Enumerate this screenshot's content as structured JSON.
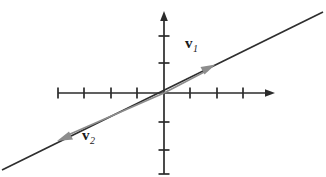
{
  "figure": {
    "background_color": "#ffffff",
    "width": 326,
    "height": 177
  },
  "axes": {
    "origin": {
      "x": 164,
      "y": 93
    },
    "color": "#2b2b2b",
    "tick_color": "#2b2b2b",
    "tick_spacing_px": 26.5,
    "tick_length_px": 11,
    "x_axis": {
      "name": "x-axis",
      "start_x": 58,
      "end_x": 275,
      "y": 93,
      "arrow_end": "right",
      "tick_positions_x": [
        58,
        84,
        111,
        137,
        190,
        217,
        243
      ],
      "label": ""
    },
    "y_axis": {
      "name": "y-axis",
      "x": 164,
      "start_y": 174,
      "end_y": 12,
      "arrow_end": "top",
      "tick_positions_y": [
        36,
        63,
        122,
        150,
        174
      ],
      "label": ""
    }
  },
  "line": {
    "name": "collinear-support-line",
    "color": "#2e2e2e",
    "width": 1.6,
    "from": {
      "x": 2,
      "y": 170
    },
    "to": {
      "x": 323,
      "y": 12
    },
    "description": "dark straight line through the origin with positive slope"
  },
  "vectors": [
    {
      "id": "v1",
      "label_base": "v",
      "label_sub": "1",
      "color": "#8d8d8d",
      "direction": "up-right",
      "tail": {
        "x": 164,
        "y": 93
      },
      "head": {
        "x": 214,
        "y": 65
      },
      "label_position": {
        "x": 185,
        "y": 36
      }
    },
    {
      "id": "v2",
      "label_base": "v",
      "label_sub": "2",
      "color": "#8d8d8d",
      "direction": "down-left",
      "tail": {
        "x": 164,
        "y": 93
      },
      "head": {
        "x": 59,
        "y": 140
      },
      "label_position": {
        "x": 82,
        "y": 128
      }
    }
  ]
}
